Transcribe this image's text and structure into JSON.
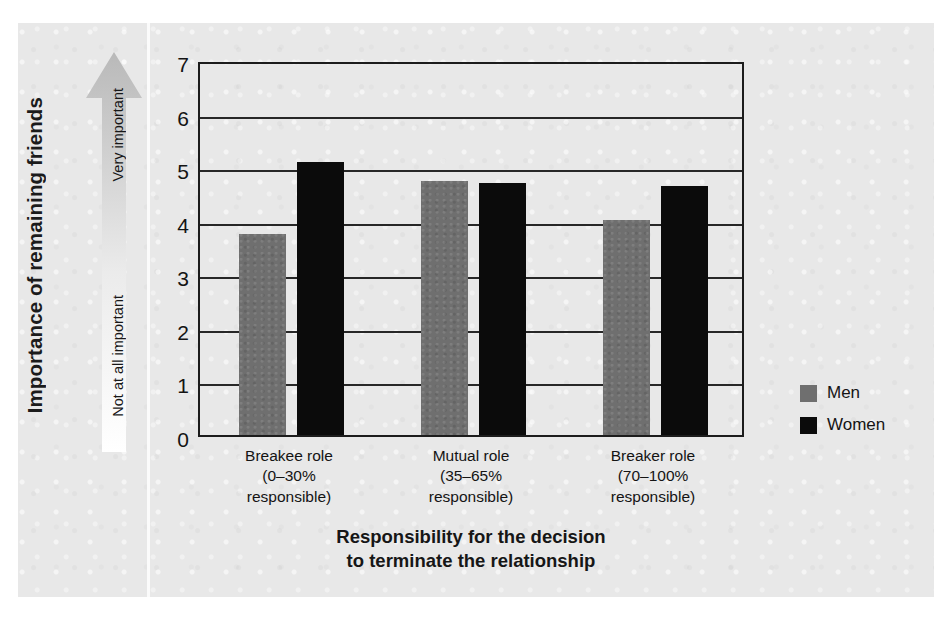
{
  "chart_data": {
    "type": "bar",
    "title": "",
    "xlabel": "Responsibility for the decision to terminate the relationship",
    "ylabel": "Importance of remaining friends",
    "ylim": [
      0,
      7
    ],
    "ytick_labels": [
      "7",
      "6",
      "5",
      "4",
      "3",
      "2",
      "1",
      "0"
    ],
    "ytick_values": [
      7,
      6,
      5,
      4,
      3,
      2,
      1,
      0
    ],
    "grid": true,
    "legend_position": "right",
    "categories": [
      "Breakee role (0–30% responsible)",
      "Mutual role (35–65% responsible)",
      "Breaker role (70–100% responsible)"
    ],
    "category_lines": [
      [
        "Breakee role",
        "(0–30%",
        "responsible)"
      ],
      [
        "Mutual role",
        "(35–65%",
        "responsible)"
      ],
      [
        "Breaker role",
        "(70–100%",
        "responsible)"
      ]
    ],
    "series": [
      {
        "name": "Men",
        "color": "#6f6f6f",
        "values": [
          3.76,
          4.74,
          4.01
        ]
      },
      {
        "name": "Women",
        "color": "#0b0b0b",
        "values": [
          5.09,
          4.71,
          4.64
        ]
      }
    ],
    "scale_annotations": {
      "high": "Very important",
      "low": "Not at all important"
    }
  },
  "axis": {
    "y_title": "Importance of remaining friends",
    "x_title_line1": "Responsibility for the decision",
    "x_title_line2": "to terminate the relationship"
  },
  "legend": {
    "items": [
      {
        "label": "Men"
      },
      {
        "label": "Women"
      }
    ]
  },
  "colors": {
    "men": "#6f6f6f",
    "women": "#0b0b0b",
    "panel": "#e8e8e8",
    "axis": "#1c1c1c"
  }
}
